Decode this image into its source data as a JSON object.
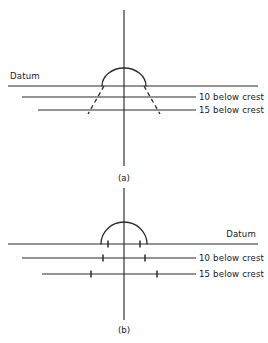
{
  "figure": {
    "background_color": "#ffffff",
    "line_color": "#2b2b2b",
    "text_color": "#1a1a1a"
  },
  "panels": [
    {
      "id": "a",
      "caption": "(a)",
      "caption_x": 124,
      "caption_y": 181,
      "axis": {
        "x": 124,
        "y_top": 10,
        "y_bottom": 166
      },
      "datum": {
        "label": "Datum",
        "label_x": 10,
        "label_y": 79,
        "label_anchor": "start",
        "line_y": 86,
        "line_x1": 8,
        "line_x2": 258
      },
      "arc": {
        "center_x": 124,
        "base_y": 86,
        "radius_x": 22,
        "radius_y": 18
      },
      "levels": [
        {
          "label": "10 below crest",
          "line_y": 97,
          "line_x1": 22,
          "line_x2": 196,
          "label_x": 199,
          "label_y": 100,
          "half_width": 26
        },
        {
          "label": "15 below crest",
          "line_y": 110,
          "line_x1": 38,
          "line_x2": 196,
          "label_x": 199,
          "label_y": 113,
          "half_width": 34
        }
      ],
      "flank_style": "dashed",
      "flank_top_half_width": 20,
      "flank_bottom_half_width": 36,
      "flank_top_y": 86,
      "flank_bottom_y": 114
    },
    {
      "id": "b",
      "caption": "(b)",
      "caption_x": 124,
      "caption_y": 333,
      "axis": {
        "x": 124,
        "y_top": 188,
        "y_bottom": 320
      },
      "datum": {
        "label": "Datum",
        "label_x": 256,
        "label_y": 237,
        "label_anchor": "end",
        "line_y": 244,
        "line_x1": 8,
        "line_x2": 258
      },
      "arc": {
        "center_x": 124,
        "base_y": 244,
        "radius_x": 23,
        "radius_y": 22
      },
      "levels": [
        {
          "label": "10 below crest",
          "line_y": 258,
          "line_x1": 22,
          "line_x2": 196,
          "label_x": 199,
          "label_y": 261,
          "half_width": 21
        },
        {
          "label": "15 below crest",
          "line_y": 274,
          "line_x1": 42,
          "line_x2": 196,
          "label_x": 199,
          "label_y": 277,
          "half_width": 33
        }
      ],
      "flank_style": "ticks",
      "datum_tick_half_width": 16,
      "tick_height": 7
    }
  ]
}
